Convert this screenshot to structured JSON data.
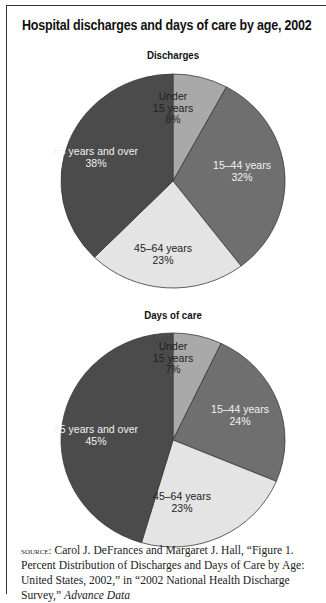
{
  "title": "Hospital discharges and days of care by age, 2002",
  "colors": {
    "under_15": "#a9a9a9",
    "15_44": "#6f6f6f",
    "45_64": "#e4e4e4",
    "65_over": "#4b4b4b",
    "label_light": "#f2f2f2",
    "label_dark": "#222222"
  },
  "chart_data": [
    {
      "type": "pie",
      "title": "Discharges",
      "categories": [
        "Under 15 years",
        "15–44 years",
        "45–64 years",
        "65 years and over"
      ],
      "values": [
        8,
        32,
        23,
        38
      ],
      "unit": "%",
      "start_angle": "12 o'clock, clockwise"
    },
    {
      "type": "pie",
      "title": "Days of care",
      "categories": [
        "Under 15 years",
        "15–44 years",
        "45–64 years",
        "65 years and over"
      ],
      "values": [
        7,
        24,
        23,
        45
      ],
      "unit": "%",
      "start_angle": "12 o'clock, clockwise"
    }
  ],
  "pies": [
    {
      "subtitle": "Discharges",
      "slices": [
        {
          "key": "under_15",
          "lines": [
            "Under",
            "15 years",
            "8%"
          ],
          "value": 8,
          "label_pos": [
            173,
            100
          ],
          "label_color": "dark"
        },
        {
          "key": "15_44",
          "lines": [
            "15–44 years",
            "32%"
          ],
          "value": 32,
          "label_pos": [
            242,
            169
          ],
          "label_color": "light"
        },
        {
          "key": "45_64",
          "lines": [
            "45–64 years",
            "23%"
          ],
          "value": 23,
          "label_pos": [
            163,
            252
          ],
          "label_color": "dark"
        },
        {
          "key": "65_over",
          "lines": [
            "65 years and over",
            "38%"
          ],
          "value": 38,
          "label_pos": [
            96,
            155
          ],
          "label_color": "light"
        }
      ]
    },
    {
      "subtitle": "Days of care",
      "slices": [
        {
          "key": "under_15",
          "lines": [
            "Under",
            "15 years",
            "7%"
          ],
          "value": 7,
          "label_pos": [
            173,
            350
          ],
          "label_color": "dark"
        },
        {
          "key": "15_44",
          "lines": [
            "15–44 years",
            "24%"
          ],
          "value": 24,
          "label_pos": [
            240,
            413
          ],
          "label_color": "light"
        },
        {
          "key": "45_64",
          "lines": [
            "45–64 years",
            "23%"
          ],
          "value": 23,
          "label_pos": [
            182,
            500
          ],
          "label_color": "dark"
        },
        {
          "key": "65_over",
          "lines": [
            "65 years and over",
            "45%"
          ],
          "value": 45,
          "label_pos": [
            96,
            433
          ],
          "label_color": "light"
        }
      ]
    }
  ],
  "source": {
    "prefix": "source:",
    "text": " Carol J. DeFrances and Margaret J. Hall, “Figure 1. Percent Distribution of Discharges and Days of Care by Age: United States, 2002,” in “2002 National Health Discharge Survey,” ",
    "italic": "Advance Data"
  }
}
